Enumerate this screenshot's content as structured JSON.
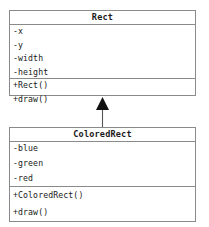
{
  "diagram": {
    "type": "uml-class-diagram",
    "background_color": "#ffffff",
    "border_color": "#8a8a8a",
    "text_color": "#202020",
    "classes": [
      {
        "name": "Rect",
        "attributes": [
          {
            "text": "-x",
            "visibility": "-",
            "member": "x"
          },
          {
            "text": "-y",
            "visibility": "-",
            "member": "y"
          },
          {
            "text": "-width",
            "visibility": "-",
            "member": "width"
          },
          {
            "text": "-height",
            "visibility": "-",
            "member": "height"
          }
        ],
        "methods": [
          {
            "text": "+Rect()",
            "visibility": "+",
            "member": "Rect()"
          },
          {
            "text": "+draw()",
            "visibility": "+",
            "member": "draw()"
          }
        ]
      },
      {
        "name": "ColoredRect",
        "attributes": [
          {
            "text": "-blue",
            "visibility": "-",
            "member": "blue"
          },
          {
            "text": "-green",
            "visibility": "-",
            "member": "green"
          },
          {
            "text": "-red",
            "visibility": "-",
            "member": "red"
          }
        ],
        "methods": [
          {
            "text": "+ColoredRect()",
            "visibility": "+",
            "member": "ColoredRect()"
          },
          {
            "text": "+draw()",
            "visibility": "+",
            "member": "draw()"
          }
        ]
      }
    ],
    "relationships": [
      {
        "kind": "generalization",
        "from": "ColoredRect",
        "to": "Rect",
        "arrowhead": "solid-triangle",
        "line_style": "solid"
      }
    ]
  }
}
